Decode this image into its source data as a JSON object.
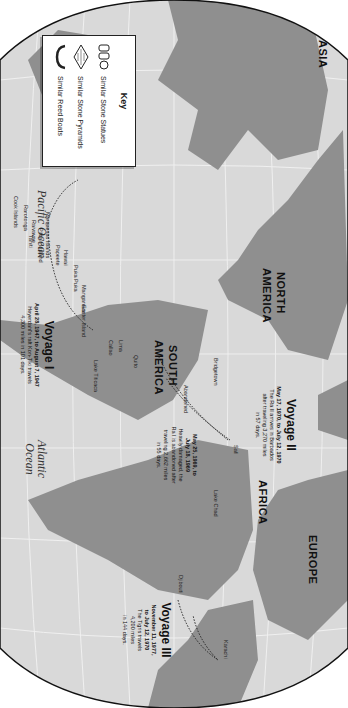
{
  "map": {
    "orientation": "rotated 90 degrees clockwise",
    "colors": {
      "land": "#8f8f8f",
      "ocean": "#d9d9d9",
      "grid": "#f2f2f2",
      "border": "#111111",
      "route": "#222222"
    },
    "continents": {
      "asia": "ASIA",
      "north_america": "NORTH AMERICA",
      "north_america_l1": "NORTH",
      "north_america_l2": "AMERICA",
      "south_america_l1": "SOUTH",
      "south_america_l2": "AMERICA",
      "africa": "AFRICA",
      "europe": "EUROPE"
    },
    "oceans": {
      "pacific": "Pacific Ocean",
      "atlantic_l1": "Atlantic",
      "atlantic_l2": "Ocean"
    },
    "places": {
      "hawaii": "Hawaii",
      "marquesas": "Marquesas Islands",
      "cook": "Cook Islands",
      "rarotonga": "Rarotonga",
      "tahiti": "Tahiti",
      "raivavae": "Raivavae",
      "pitcairn": "Pitcairn Island",
      "papeete": "Papeete",
      "puka_puka": "Puka Puka",
      "mangareva": "Mangareva",
      "easter": "Easter Island",
      "callao": "Callao",
      "lima": "Lima",
      "quito": "Quito",
      "lake_titicaca": "Lake Titicaca",
      "bridgetown": "Bridgetown",
      "abandoned": "Abandoned",
      "safi": "Safi",
      "lake_chad": "Lake Chad",
      "djibouti": "Djibouti",
      "karachi": "Karachi"
    }
  },
  "key": {
    "title": "Key",
    "items": [
      {
        "icon": "stone-statue-icon",
        "label": "Similar Stone Statues"
      },
      {
        "icon": "stone-pyramid-icon",
        "label": "Similar Stone Pyramids"
      },
      {
        "icon": "reed-boat-icon",
        "label": "Similar Reed Boats"
      }
    ]
  },
  "voyages": [
    {
      "title": "Voyage I",
      "dates": "April 28, 1947, to August 7, 1947",
      "desc_l1": "Heyerdahl's raft Kon-Tiki travels",
      "desc_l2": "4,300 miles in 101 days."
    },
    {
      "title": "Voyage II",
      "dates_l1": "May 17, 1970, to July 12, 1970",
      "desc_l1": "The Ra II arrives in Barbados",
      "desc_l2": "after traveling 3,270 miles",
      "desc_l3": "in 57 days."
    },
    {
      "title": "",
      "dates_l1": "May 25, 1969, to",
      "dates_l2": "July 18, 1969",
      "desc_l1": "Heavily damaged, the",
      "desc_l2": "Ra I is abandoned after",
      "desc_l3": "traveling 2,662 miles",
      "desc_l4": "in 55 days."
    },
    {
      "title": "Voyage III",
      "dates_l1": "November 11, 1977,",
      "dates_l2": "to July 12, 1970",
      "desc_l1": "The Tigris travels",
      "desc_l2": "4,200 miles",
      "desc_l3": "in 144 days."
    }
  ]
}
